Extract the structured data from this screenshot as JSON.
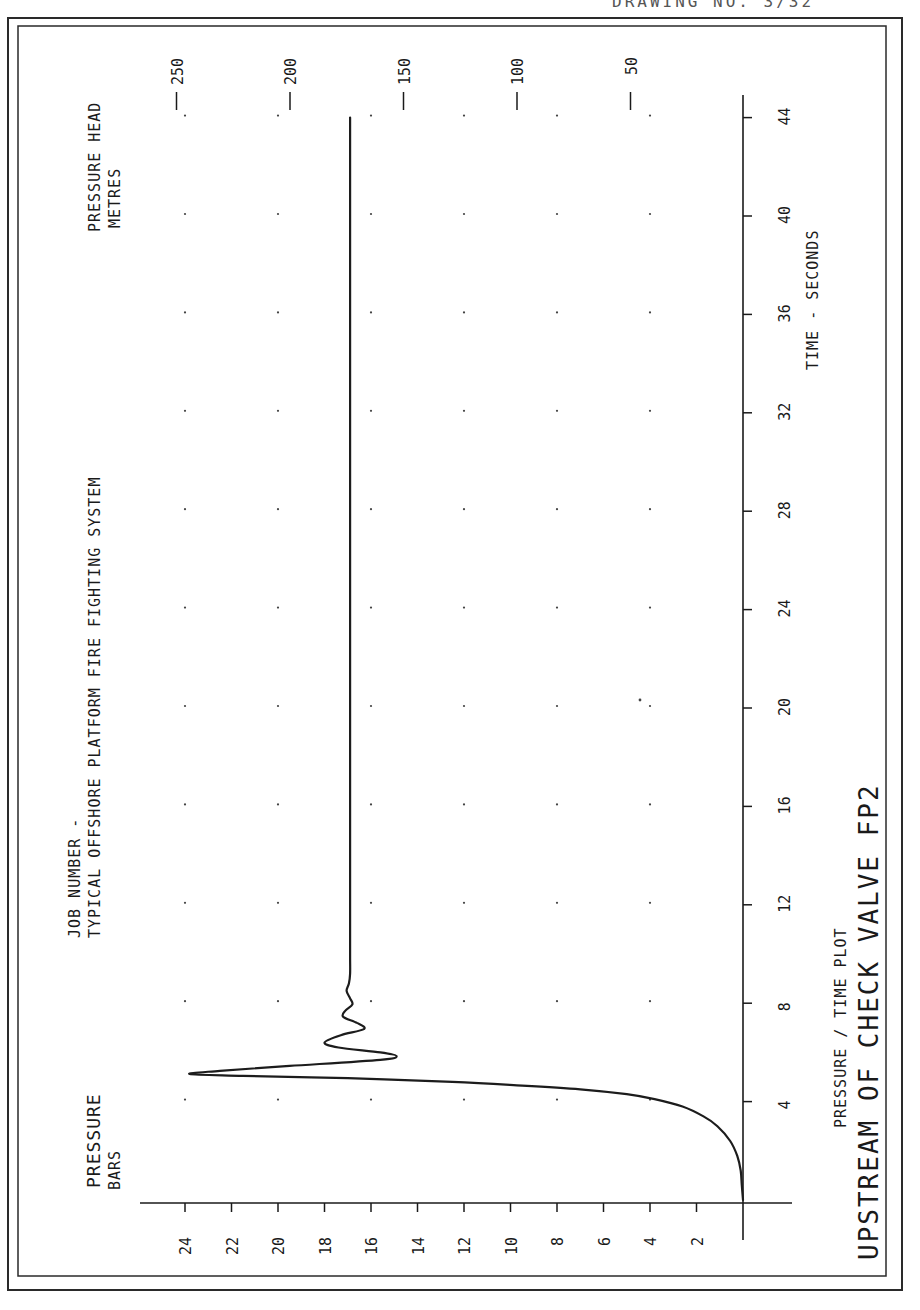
{
  "page": {
    "orientation": "rotated-90-ccw",
    "header_scrap": "DRAWING NO. 3/32"
  },
  "colors": {
    "ink": "#1a1a1a",
    "paper": "#ffffff"
  },
  "labels": {
    "job_number": "JOB NUMBER -",
    "system": "TYPICAL OFFSHORE PLATFORM FIRE FIGHTING SYSTEM",
    "pressure_title": "PRESSURE",
    "pressure_unit": "BARS",
    "head_title": "PRESSURE HEAD",
    "head_unit": "METRES",
    "time_axis": "TIME - SECONDS",
    "plot_type": "PRESSURE / TIME PLOT",
    "plot_title": "UPSTREAM OF CHECK VALVE FP2"
  },
  "chart_data": {
    "type": "line",
    "title": "UPSTREAM OF CHECK VALVE FP2",
    "subtitle": "PRESSURE / TIME PLOT",
    "header": [
      "JOB NUMBER -",
      "TYPICAL OFFSHORE PLATFORM FIRE FIGHTING SYSTEM"
    ],
    "xlabel": "TIME - SECONDS",
    "ylabel": "PRESSURE BARS",
    "y2label": "PRESSURE HEAD METRES",
    "xlim": [
      0,
      46
    ],
    "ylim": [
      0,
      26
    ],
    "y2lim": [
      0,
      265
    ],
    "x_ticks": [
      4,
      8,
      12,
      16,
      20,
      24,
      28,
      32,
      36,
      40,
      44
    ],
    "y_ticks": [
      2,
      4,
      6,
      8,
      10,
      12,
      14,
      16,
      18,
      20,
      22,
      24
    ],
    "y2_ticks": [
      50,
      100,
      150,
      200,
      250
    ],
    "grid": "dots",
    "legend": null,
    "series": [
      {
        "name": "Pressure upstream of check valve FP2",
        "x": [
          0.0,
          0.6,
          1.2,
          1.8,
          2.4,
          3.0,
          3.4,
          3.8,
          4.1,
          4.3,
          4.5,
          4.65,
          4.8,
          4.95,
          5.05,
          5.12,
          5.25,
          5.45,
          5.7,
          5.85,
          6.0,
          6.2,
          6.4,
          6.7,
          6.95,
          7.2,
          7.45,
          7.7,
          7.95,
          8.2,
          8.5,
          8.8,
          9.2,
          10.0,
          12.0,
          16.0,
          20.0,
          24.0,
          28.0,
          32.0,
          36.0,
          40.0,
          44.0
        ],
        "y": [
          0.0,
          0.05,
          0.1,
          0.25,
          0.55,
          1.1,
          1.7,
          2.6,
          3.8,
          5.0,
          7.0,
          9.5,
          12.5,
          17.0,
          21.5,
          23.8,
          22.5,
          19.5,
          15.6,
          14.9,
          15.6,
          17.4,
          18.0,
          17.3,
          16.3,
          16.6,
          17.2,
          17.1,
          16.8,
          16.9,
          17.05,
          16.95,
          16.9,
          16.9,
          16.9,
          16.9,
          16.9,
          16.9,
          16.9,
          16.9,
          16.9,
          16.9,
          16.9
        ]
      }
    ],
    "annotations": {
      "peak_pressure_bar": 23.8,
      "peak_time_s": 5.1,
      "steady_pressure_bar": 16.9
    }
  },
  "geometry": {
    "origin_px": [
      743,
      1203
    ],
    "px_per_bar": 23.25,
    "px_per_second": 24.6,
    "px_per_metre": 2.27,
    "head_zero_px": 744,
    "frame_outer": [
      8,
      18,
      902,
      1290
    ],
    "frame_inner": [
      18,
      26,
      886,
      1276
    ]
  }
}
